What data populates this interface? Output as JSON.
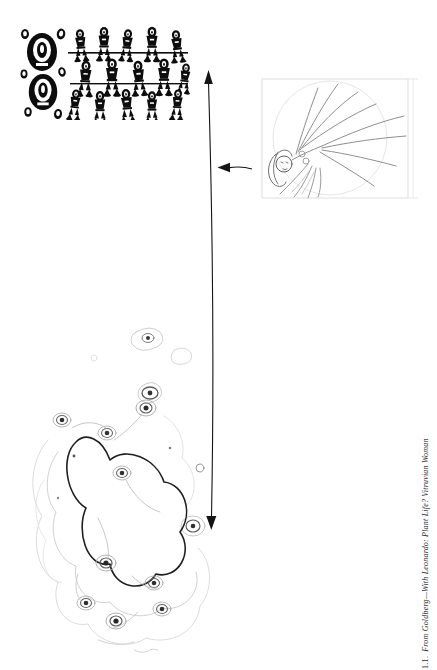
{
  "figure": {
    "caption_number": "1.1.",
    "caption_title": "From Goldberg—With Leonardo: Plant Life? Vitruvian Woman",
    "colors": {
      "ink": "#141414",
      "pencil": "#8f8f8f",
      "frame": "#d6d6d6",
      "contour_light": "#cccccc",
      "contour_mid": "#8a8a8a",
      "contour_dark": "#2f2f2f"
    },
    "icons": {
      "vertical_arrow": "double-headed-arrow",
      "side_arrow": "left-arrow"
    }
  }
}
